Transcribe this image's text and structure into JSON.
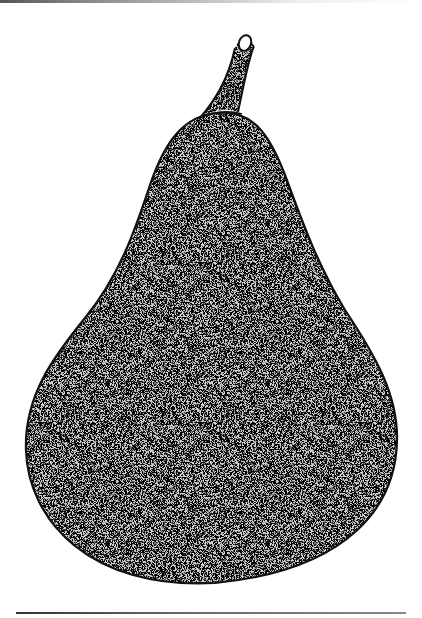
{
  "image": {
    "subject": "pear",
    "style": "stippled pen-and-ink illustration",
    "colors": {
      "background": "#ffffff",
      "outline": "#111111",
      "stipple_fill": "#bdbdbd",
      "stipple_dot": "#333333"
    },
    "parts": [
      "stem",
      "body",
      "top-rule",
      "bottom-rule"
    ]
  }
}
